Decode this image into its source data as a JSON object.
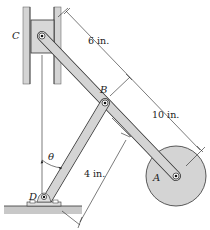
{
  "figure": {
    "type": "mechanism-diagram",
    "colors": {
      "member_fill": "#d4d4d4",
      "member_stroke": "#333333",
      "ground_fill": "#c8c8c8",
      "line": "#222222",
      "background": "#ffffff"
    },
    "points": {
      "A": {
        "label": "A",
        "x": 176,
        "y": 176
      },
      "B": {
        "label": "B",
        "x": 105,
        "y": 103
      },
      "C": {
        "label": "C",
        "x": 42,
        "y": 36
      },
      "D": {
        "label": "D",
        "x": 44,
        "y": 205
      }
    },
    "angle": {
      "label": "θ"
    },
    "dimensions": [
      {
        "id": "CB",
        "label": "6 in."
      },
      {
        "id": "BA",
        "label": "10 in."
      },
      {
        "id": "DB",
        "label": "4 in."
      }
    ]
  }
}
